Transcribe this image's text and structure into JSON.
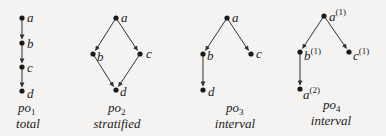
{
  "figure": {
    "diagrams": [
      {
        "id": "po1",
        "name": "po",
        "subscript": "1",
        "kind": "total",
        "nodes": [
          {
            "label": "a",
            "sup": "",
            "x": 22,
            "y": 18
          },
          {
            "label": "b",
            "sup": "",
            "x": 22,
            "y": 43
          },
          {
            "label": "c",
            "sup": "",
            "x": 22,
            "y": 67
          },
          {
            "label": "d",
            "sup": "",
            "x": 22,
            "y": 91
          }
        ],
        "edges": [
          [
            "a",
            "b"
          ],
          [
            "b",
            "c"
          ],
          [
            "c",
            "d"
          ]
        ]
      },
      {
        "id": "po2",
        "name": "po",
        "subscript": "2",
        "kind": "stratified",
        "nodes": [
          {
            "label": "a",
            "sup": "",
            "x": 116,
            "y": 18
          },
          {
            "label": "b",
            "sup": "",
            "x": 93,
            "y": 54
          },
          {
            "label": "c",
            "sup": "",
            "x": 140,
            "y": 54
          },
          {
            "label": "d",
            "sup": "",
            "x": 116,
            "y": 90
          }
        ],
        "edges": [
          [
            "a",
            "b"
          ],
          [
            "a",
            "c"
          ],
          [
            "b",
            "d"
          ],
          [
            "c",
            "d"
          ]
        ]
      },
      {
        "id": "po3",
        "name": "po",
        "subscript": "3",
        "kind": "interval",
        "nodes": [
          {
            "label": "a",
            "sup": "",
            "x": 227,
            "y": 18
          },
          {
            "label": "b",
            "sup": "",
            "x": 203,
            "y": 54
          },
          {
            "label": "c",
            "sup": "",
            "x": 251,
            "y": 54
          },
          {
            "label": "d",
            "sup": "",
            "x": 203,
            "y": 90
          }
        ],
        "edges": [
          [
            "a",
            "b"
          ],
          [
            "a",
            "c"
          ],
          [
            "b",
            "d"
          ]
        ]
      },
      {
        "id": "po4",
        "name": "po",
        "subscript": "4",
        "kind": "interval",
        "nodes": [
          {
            "label": "a",
            "sup": "(1)",
            "x": 324,
            "y": 16
          },
          {
            "label": "b",
            "sup": "(1)",
            "x": 300,
            "y": 52
          },
          {
            "label": "c",
            "sup": "(1)",
            "x": 349,
            "y": 52
          },
          {
            "label": "a",
            "sup": "(2)",
            "x": 300,
            "y": 89
          }
        ],
        "edges": [
          [
            0,
            1
          ],
          [
            0,
            2
          ],
          [
            1,
            3
          ]
        ]
      }
    ]
  }
}
